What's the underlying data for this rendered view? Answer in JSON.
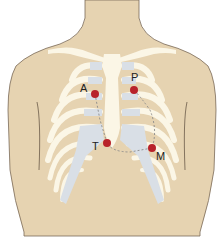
{
  "figure": {
    "colors": {
      "background": "#ffffff",
      "skin": "#e6d3b1",
      "skin_outline": "#7a6a58",
      "bone": "#fbf6e6",
      "cartilage": "#d9dfe6",
      "point": "#b8222a",
      "path": "#8a8a8a"
    },
    "points": [
      {
        "id": "A",
        "label": "A",
        "x": 95,
        "y": 94
      },
      {
        "id": "P",
        "label": "P",
        "x": 134,
        "y": 90
      },
      {
        "id": "T",
        "label": "T",
        "x": 107,
        "y": 143
      },
      {
        "id": "M",
        "label": "M",
        "x": 152,
        "y": 148
      }
    ]
  }
}
